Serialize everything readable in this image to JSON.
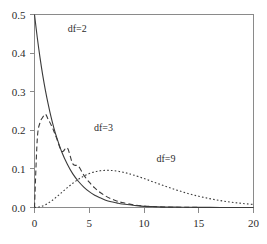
{
  "chart_data": {
    "type": "line",
    "title": "",
    "subtitle": "",
    "xlabel": "",
    "ylabel": "",
    "xlim": [
      0,
      20
    ],
    "ylim": [
      0,
      0.5
    ],
    "grid": false,
    "legend_position": "inline-annotations",
    "x_ticks": [
      "0",
      "5",
      "10",
      "15",
      "20"
    ],
    "x_tick_values": [
      0,
      5,
      10,
      15,
      20
    ],
    "y_ticks": [
      "0.0",
      "0.1",
      "0.2",
      "0.3",
      "0.4",
      "0.5"
    ],
    "y_tick_values": [
      0.0,
      0.1,
      0.2,
      0.3,
      0.4,
      0.5
    ],
    "annotations": [
      {
        "text": "df=2",
        "x": 3.9,
        "y": 0.455
      },
      {
        "text": "df=3",
        "x": 6.3,
        "y": 0.197
      },
      {
        "text": "df=9",
        "x": 12.0,
        "y": 0.117
      }
    ],
    "series": [
      {
        "name": "df=2",
        "label": "df=2",
        "style": "solid",
        "color": "#3a3a3a",
        "x": [
          0,
          0.25,
          0.5,
          0.75,
          1,
          1.25,
          1.5,
          1.75,
          2,
          2.5,
          3,
          3.5,
          4,
          4.5,
          5,
          5.5,
          6,
          6.5,
          7,
          7.5,
          8,
          9,
          10,
          11,
          12,
          13,
          14,
          15,
          16,
          17,
          18,
          19,
          20
        ],
        "y": [
          0.5,
          0.441,
          0.389,
          0.343,
          0.303,
          0.268,
          0.236,
          0.208,
          0.184,
          0.143,
          0.112,
          0.087,
          0.068,
          0.053,
          0.041,
          0.032,
          0.025,
          0.019,
          0.015,
          0.012,
          0.009,
          0.006,
          0.003,
          0.002,
          0.001,
          0.001,
          0.0005,
          0.0003,
          0.0002,
          0.0001,
          0.0001,
          0.0001,
          0.0
        ]
      },
      {
        "name": "df=3",
        "label": "df=3",
        "style": "dashed",
        "color": "#3a3a3a",
        "x": [
          0,
          0.25,
          0.5,
          0.75,
          1,
          1.25,
          1.5,
          1.75,
          2,
          2.5,
          3,
          3.5,
          4,
          4.5,
          5,
          5.5,
          6,
          6.5,
          7,
          7.5,
          8,
          9,
          10,
          11,
          12,
          13,
          14,
          15,
          16,
          17,
          18,
          19,
          20
        ],
        "y": [
          0.0,
          0.1759,
          0.2197,
          0.2336,
          0.242,
          0.2283,
          0.2153,
          0.1989,
          0.181,
          0.1453,
          0.1542,
          0.113,
          0.1075,
          0.0839,
          0.0655,
          0.0506,
          0.0389,
          0.0297,
          0.0225,
          0.017,
          0.0128,
          0.0072,
          0.004,
          0.0022,
          0.0012,
          0.0007,
          0.0004,
          0.0002,
          0.0001,
          0.0001,
          0.0,
          0.0,
          0.0
        ]
      },
      {
        "name": "df=9",
        "label": "df=9",
        "style": "dotted",
        "color": "#3a3a3a",
        "x": [
          0,
          0.5,
          1,
          1.5,
          2,
          2.5,
          3,
          3.5,
          4,
          4.5,
          5,
          5.5,
          6,
          6.5,
          7,
          7.5,
          8,
          8.5,
          9,
          10,
          11,
          12,
          13,
          14,
          15,
          16,
          17,
          18,
          19,
          20
        ],
        "y": [
          0.0,
          0.0018,
          0.0073,
          0.016,
          0.0271,
          0.0392,
          0.0514,
          0.0628,
          0.0729,
          0.0813,
          0.0878,
          0.0924,
          0.0952,
          0.0963,
          0.096,
          0.0945,
          0.0919,
          0.0885,
          0.0845,
          0.075,
          0.0647,
          0.0545,
          0.045,
          0.0365,
          0.0291,
          0.0229,
          0.0178,
          0.0137,
          0.0104,
          0.0079
        ]
      }
    ]
  }
}
